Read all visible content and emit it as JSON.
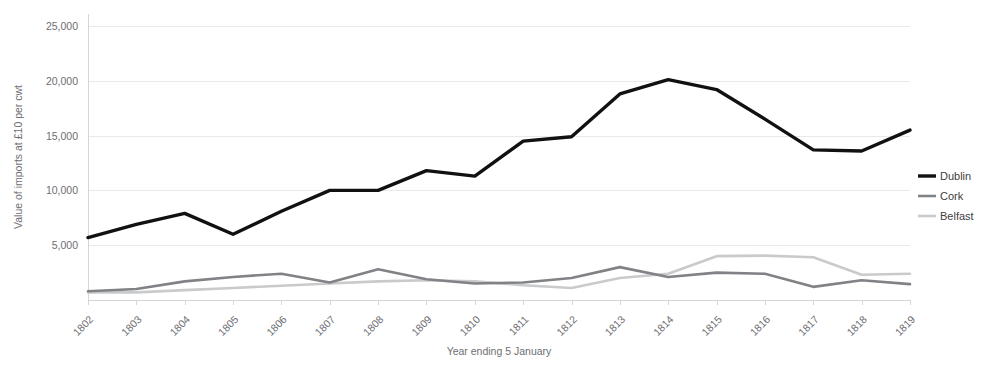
{
  "chart_data": {
    "type": "line",
    "title": "",
    "xlabel": "Year ending 5 January",
    "ylabel": "Value of imports at £10 per cwt",
    "categories": [
      "1802",
      "1803",
      "1804",
      "1805",
      "1806",
      "1807",
      "1808",
      "1809",
      "1810",
      "1811",
      "1812",
      "1813",
      "1814",
      "1815",
      "1816",
      "1817",
      "1818",
      "1819"
    ],
    "ylim": [
      0,
      25000
    ],
    "yticks": [
      5000,
      10000,
      15000,
      20000,
      25000
    ],
    "ytick_labels": [
      "5,000",
      "10,000",
      "15,000",
      "20,000",
      "25,000"
    ],
    "grid": true,
    "legend_position": "right",
    "series": [
      {
        "name": "Dublin",
        "color": "#111111",
        "width": 3.4,
        "values": [
          5700,
          6900,
          7900,
          6000,
          8100,
          10000,
          10000,
          11800,
          11300,
          14500,
          14900,
          18800,
          20100,
          19200,
          16500,
          13700,
          13600,
          15500
        ]
      },
      {
        "name": "Cork",
        "color": "#808285",
        "width": 2.6,
        "values": [
          800,
          1000,
          1700,
          2100,
          2400,
          1600,
          2800,
          1900,
          1500,
          1600,
          2000,
          3000,
          2100,
          2500,
          2400,
          1200,
          1800,
          1450
        ]
      },
      {
        "name": "Belfast",
        "color": "#c9cacb",
        "width": 2.6,
        "values": [
          700,
          700,
          900,
          1100,
          1300,
          1500,
          1700,
          1800,
          1700,
          1350,
          1100,
          2000,
          2400,
          4000,
          4050,
          3900,
          2300,
          2400
        ]
      }
    ]
  },
  "legend": {
    "items": [
      {
        "label": "Dublin"
      },
      {
        "label": "Cork"
      },
      {
        "label": "Belfast"
      }
    ]
  },
  "axes": {
    "y_title": "Value of imports at £10 per cwt",
    "x_title": "Year ending 5 January"
  }
}
